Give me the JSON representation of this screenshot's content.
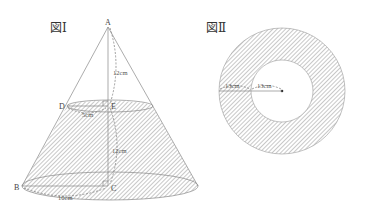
{
  "figures": [
    {
      "title": "図Ⅰ",
      "type": "truncated-cone-in-cone",
      "points": {
        "A": "A",
        "B": "B",
        "C": "C",
        "D": "D",
        "E": "E"
      },
      "dimensions": {
        "AE": "12cm",
        "EC": "12cm",
        "DE": "5cm",
        "BC": "10cm"
      }
    },
    {
      "title": "図Ⅱ",
      "type": "annulus",
      "dimensions": {
        "outer_band": "13cm",
        "inner_radius": "13cm"
      }
    }
  ],
  "colors": {
    "hatch": "#9a9a9a",
    "line": "#888888",
    "text": "#444444"
  }
}
